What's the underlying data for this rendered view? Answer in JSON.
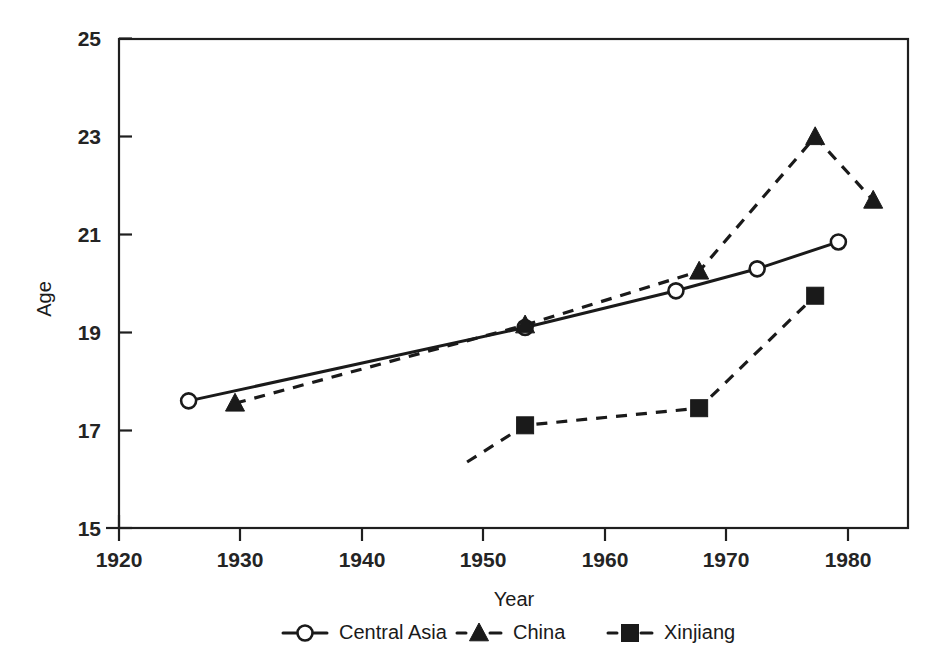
{
  "chart_data": {
    "type": "line",
    "title": "",
    "xlabel": "Year",
    "ylabel": "Age",
    "xlim": [
      1920,
      1988
    ],
    "ylim": [
      15,
      25
    ],
    "xticks": [
      1920,
      1930,
      1940,
      1950,
      1960,
      1970,
      1980
    ],
    "yticks": [
      15,
      17,
      19,
      21,
      23,
      25
    ],
    "xtick_labels": [
      "1920",
      "1930",
      "1940",
      "1950",
      "1960",
      "1970",
      "1980"
    ],
    "ytick_labels": [
      "15",
      "17",
      "19",
      "21",
      "23",
      "25"
    ],
    "grid": false,
    "legend_position": "below",
    "series": [
      {
        "name": "Central Asia",
        "marker": "open-circle",
        "linestyle": "solid",
        "color": "#1a1a1a",
        "x": [
          1926,
          1955,
          1968,
          1975,
          1982
        ],
        "y": [
          17.6,
          19.1,
          19.85,
          20.3,
          20.85
        ]
      },
      {
        "name": "China",
        "marker": "filled-triangle",
        "linestyle": "dashed",
        "color": "#1a1a1a",
        "x": [
          1930,
          1955,
          1970,
          1980,
          1985
        ],
        "y": [
          17.55,
          19.15,
          20.25,
          23.0,
          21.7
        ]
      },
      {
        "name": "Xinjiang",
        "marker": "filled-square",
        "linestyle": "dashed",
        "color": "#1a1a1a",
        "x": [
          1950,
          1955,
          1970,
          1980
        ],
        "y": [
          16.35,
          17.1,
          17.45,
          19.75
        ],
        "marker_visible": [
          false,
          true,
          true,
          true
        ]
      }
    ]
  },
  "legend": {
    "items": [
      {
        "label": "Central Asia",
        "marker": "open-circle",
        "linestyle": "solid"
      },
      {
        "label": "China",
        "marker": "filled-triangle",
        "linestyle": "dashed"
      },
      {
        "label": "Xinjiang",
        "marker": "filled-square",
        "linestyle": "dashed"
      }
    ]
  },
  "axis_titles": {
    "x": "Year",
    "y": "Age"
  }
}
